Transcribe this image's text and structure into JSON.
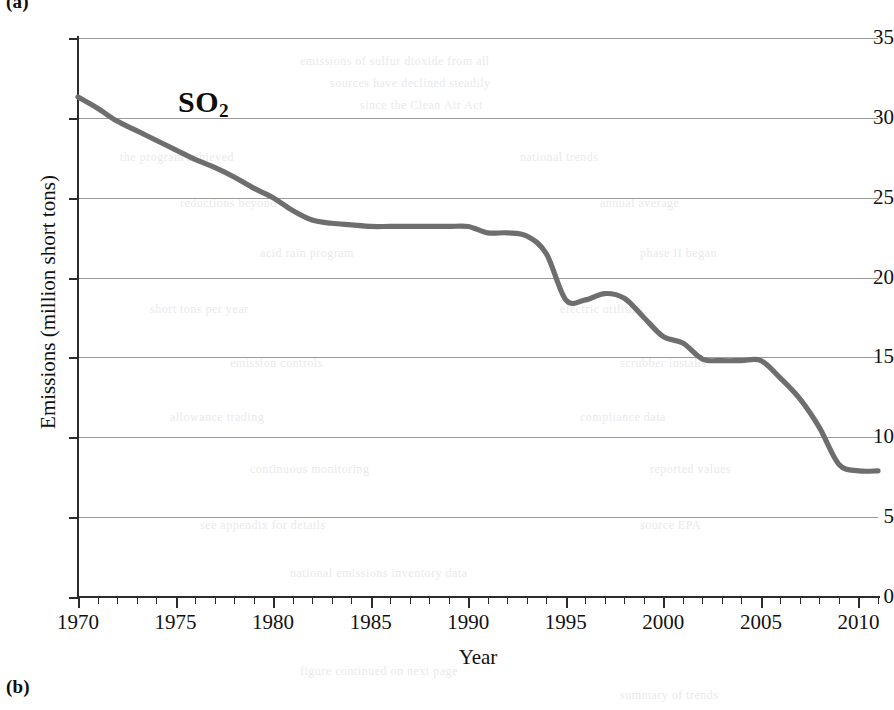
{
  "figure": {
    "panel_label_top": "(a)",
    "panel_label_bottom": "(b)",
    "series_annotation_main": "SO",
    "series_annotation_sub": "2"
  },
  "chart_data": {
    "type": "line",
    "title": "SO2",
    "xlabel": "Year",
    "ylabel": "Emissions (million short tons)",
    "xlim": [
      1970,
      2011
    ],
    "ylim": [
      0,
      35
    ],
    "grid": true,
    "legend": "none",
    "line_color": "#6e6e6e",
    "x_major_ticks": [
      1970,
      1975,
      1980,
      1985,
      1990,
      1995,
      2000,
      2005,
      2010
    ],
    "x_tick_labels": [
      "1970",
      "1975",
      "1980",
      "1985",
      "1990",
      "1995",
      "2000",
      "2005",
      "2010"
    ],
    "x_minor_tick_interval": 1,
    "y_ticks": [
      0,
      5,
      10,
      15,
      20,
      25,
      30,
      35
    ],
    "y_tick_labels": [
      "0",
      "5",
      "10",
      "15",
      "20",
      "25",
      "30",
      "35"
    ],
    "x": [
      1970,
      1971,
      1972,
      1973,
      1974,
      1975,
      1976,
      1977,
      1978,
      1979,
      1980,
      1981,
      1982,
      1983,
      1984,
      1985,
      1986,
      1987,
      1988,
      1989,
      1990,
      1991,
      1992,
      1993,
      1994,
      1995,
      1996,
      1997,
      1998,
      1999,
      2000,
      2001,
      2002,
      2003,
      2004,
      2005,
      2006,
      2007,
      2008,
      2009,
      2010,
      2011
    ],
    "values": [
      31.3,
      30.6,
      29.8,
      29.2,
      28.6,
      28.0,
      27.4,
      26.9,
      26.3,
      25.6,
      25.0,
      24.2,
      23.6,
      23.4,
      23.3,
      23.2,
      23.2,
      23.2,
      23.2,
      23.2,
      23.2,
      22.8,
      22.8,
      22.6,
      21.5,
      18.6,
      18.6,
      19.0,
      18.7,
      17.5,
      16.3,
      15.9,
      14.9,
      14.8,
      14.8,
      14.8,
      13.7,
      12.4,
      10.6,
      8.3,
      7.9,
      7.9
    ],
    "series_name": "SO2 emissions"
  },
  "ghost_artifacts": [
    {
      "text": "emissions of sulfur dioxide from all",
      "x": 300,
      "y": 54
    },
    {
      "text": "sources have declined steadily",
      "x": 330,
      "y": 76
    },
    {
      "text": "since the Clean Air Act",
      "x": 360,
      "y": 98
    },
    {
      "text": "the program achieved",
      "x": 120,
      "y": 150
    },
    {
      "text": "national trends",
      "x": 520,
      "y": 150
    },
    {
      "text": "reductions beyond",
      "x": 180,
      "y": 196
    },
    {
      "text": "annual average",
      "x": 600,
      "y": 196
    },
    {
      "text": "acid rain program",
      "x": 260,
      "y": 246
    },
    {
      "text": "phase II began",
      "x": 640,
      "y": 246
    },
    {
      "text": "short tons per year",
      "x": 150,
      "y": 302
    },
    {
      "text": "electric utilities",
      "x": 560,
      "y": 302
    },
    {
      "text": "emission controls",
      "x": 230,
      "y": 356
    },
    {
      "text": "scrubber installs",
      "x": 620,
      "y": 356
    },
    {
      "text": "allowance trading",
      "x": 170,
      "y": 410
    },
    {
      "text": "compliance data",
      "x": 580,
      "y": 410
    },
    {
      "text": "continuous monitoring",
      "x": 250,
      "y": 462
    },
    {
      "text": "reported values",
      "x": 650,
      "y": 462
    },
    {
      "text": "see appendix for details",
      "x": 200,
      "y": 518
    },
    {
      "text": "source EPA",
      "x": 640,
      "y": 518
    },
    {
      "text": "national emissions inventory data",
      "x": 290,
      "y": 566
    },
    {
      "text": "figure continued on next page",
      "x": 300,
      "y": 664
    },
    {
      "text": "summary of trends",
      "x": 620,
      "y": 688
    }
  ]
}
